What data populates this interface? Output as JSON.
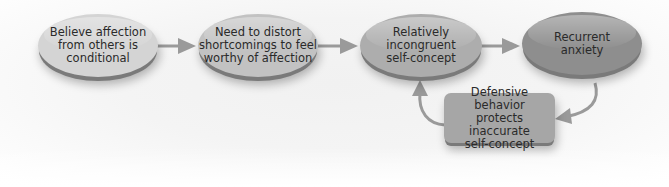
{
  "diagram": {
    "nodes": [
      {
        "id": "n1",
        "shape": "oval",
        "label": "Believe affection\nfrom others is\nconditional",
        "lines": [
          "Believe affection",
          "from others is",
          "conditional"
        ],
        "fill": "#d4d4d4"
      },
      {
        "id": "n2",
        "shape": "oval",
        "label": "Need to distort\nshortcomings to feel\nworthy of affection",
        "lines": [
          "Need to distort",
          "shortcomings to feel",
          "worthy of affection"
        ],
        "fill": "#c2c2c2"
      },
      {
        "id": "n3",
        "shape": "oval",
        "label": "Relatively\nincongruent\nself-concept",
        "lines": [
          "Relatively",
          "incongruent",
          "self-concept"
        ],
        "fill": "#adadad"
      },
      {
        "id": "n4",
        "shape": "oval",
        "label": "Recurrent\nanxiety",
        "lines": [
          "Recurrent",
          "anxiety"
        ],
        "fill": "#8e8e8e"
      },
      {
        "id": "n5",
        "shape": "rounded-box",
        "label": "Defensive behavior\nprotects inaccurate\nself-concept",
        "lines": [
          "Defensive behavior",
          "protects inaccurate",
          "self-concept"
        ],
        "fill": "#a6a6a6"
      }
    ],
    "edges": [
      {
        "from": "n1",
        "to": "n2"
      },
      {
        "from": "n2",
        "to": "n3"
      },
      {
        "from": "n3",
        "to": "n4"
      },
      {
        "from": "n4",
        "to": "n5"
      },
      {
        "from": "n5",
        "to": "n3"
      }
    ],
    "colors": {
      "arrow": "#9a9a9a",
      "text": "#2a2a2a",
      "background": "#f3f3f3"
    }
  }
}
